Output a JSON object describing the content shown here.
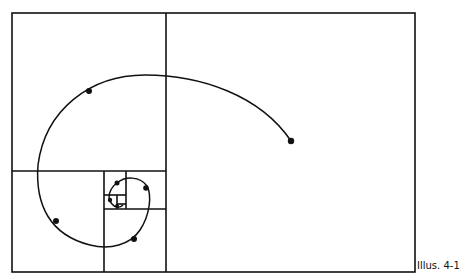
{
  "figure": {
    "caption": "Illus. 4-1",
    "colors": {
      "line": "#111111",
      "background": "#ffffff"
    },
    "spiral_points": 8
  }
}
